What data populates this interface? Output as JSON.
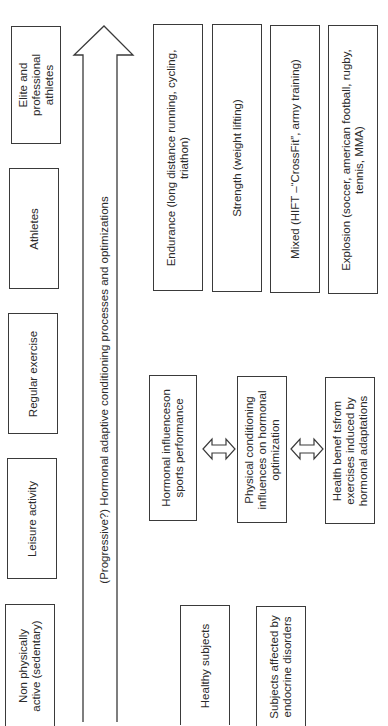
{
  "diagram": {
    "orientation": "rotated-90-ccw",
    "stroke_color": "#3a3a3a",
    "background_color": "#ffffff",
    "activity_levels": [
      {
        "label": "Elite and professional athletes"
      },
      {
        "label": "Athletes"
      },
      {
        "label": "Regular exercise"
      },
      {
        "label": "Leisure activity"
      },
      {
        "label": "Non physically active (sedentary)"
      }
    ],
    "progression_arrow": {
      "label": "(Progressive?) Hormonal adaptive conditioning processes and optimizations"
    },
    "sport_types": [
      {
        "label": "Endurance (long distance running, cycling, triathon)"
      },
      {
        "label": "Strength (weight lifting)"
      },
      {
        "label": "Mixed (HIFT –“CrossFit”, army training)"
      },
      {
        "label": "Explosion (soccer, american football, rugby, tennis, MMA)"
      }
    ],
    "hormonal_chain": [
      {
        "label": "Hormonal influenceson sports performance"
      },
      {
        "label": "Physical conditioning influences on hormonal optimization"
      },
      {
        "label": "Health benef tsfrom exercises induced by hormonal adaptations"
      }
    ],
    "subject_groups": [
      {
        "label": "Healthy subjects"
      },
      {
        "label": "Subjects affected by endocrine disorders"
      }
    ]
  }
}
